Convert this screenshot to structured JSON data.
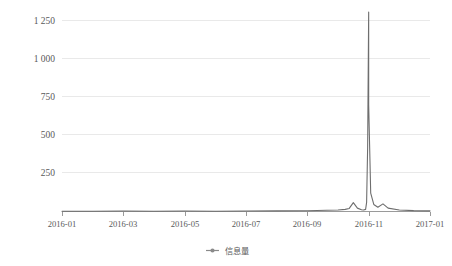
{
  "chart_data": {
    "type": "line",
    "title": "",
    "subtitle": "",
    "xlabel": "",
    "ylabel": "",
    "grid": true,
    "legend_position": "bottom",
    "ylim": [
      0,
      1330
    ],
    "yticks": [
      250,
      500,
      750,
      1000,
      1250
    ],
    "ytick_labels": [
      "250",
      "500",
      "750",
      "1 000",
      "1 250"
    ],
    "xtick_labels": [
      "2016-01",
      "2016-03",
      "2016-05",
      "2016-07",
      "2016-09",
      "2016-11",
      "2017-01"
    ],
    "xlim": [
      "2016-01",
      "2017-01"
    ],
    "series": [
      {
        "name": "信息量",
        "color": "#6e6e6e",
        "x": [
          "2016-01",
          "2016-02",
          "2016-03",
          "2016-04",
          "2016-05",
          "2016-06",
          "2016-07",
          "2016-08",
          "2016-09",
          "2016-09-20",
          "2016-10-01",
          "2016-10-08",
          "2016-10-12",
          "2016-10-16",
          "2016-10-20",
          "2016-10-24",
          "2016-10-26",
          "2016-10-28",
          "2016-10-29",
          "2016-10-30",
          "2016-10-31",
          "2016-11-01",
          "2016-11-03",
          "2016-11-06",
          "2016-11-10",
          "2016-11-15",
          "2016-11-20",
          "2016-12-01",
          "2016-12-15",
          "2017-01"
        ],
        "values": [
          2,
          2,
          3,
          2,
          3,
          2,
          3,
          4,
          5,
          8,
          10,
          14,
          20,
          58,
          22,
          12,
          10,
          14,
          60,
          420,
          1305,
          700,
          120,
          46,
          28,
          50,
          22,
          10,
          6,
          4
        ]
      }
    ]
  },
  "legend": {
    "items": [
      {
        "label": "信息量",
        "marker": "line-dot-marker",
        "color": "#8a8a8a"
      }
    ]
  },
  "axes": {
    "y_axis_name": "y-axis",
    "x_axis_name": "x-axis"
  }
}
